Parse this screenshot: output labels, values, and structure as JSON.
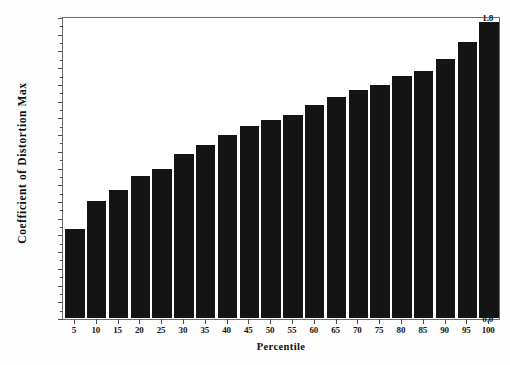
{
  "chart_data": {
    "type": "bar",
    "title": "",
    "xlabel": "Percentile",
    "ylabel": "Coefficient of Distortion Max",
    "categories": [
      "5",
      "10",
      "15",
      "20",
      "25",
      "30",
      "35",
      "40",
      "45",
      "50",
      "55",
      "60",
      "65",
      "70",
      "75",
      "80",
      "85",
      "90",
      "95",
      "100"
    ],
    "values": [
      0.535,
      0.705,
      0.77,
      0.855,
      0.9,
      0.985,
      1.04,
      1.1,
      1.155,
      1.19,
      1.225,
      1.285,
      1.33,
      1.37,
      1.405,
      1.455,
      1.49,
      1.56,
      1.66,
      1.785
    ],
    "ylim": [
      0.0,
      1.8
    ],
    "y_ticks": [
      "0.0",
      "0.1",
      "0.2",
      "0.3",
      "0.4",
      "0.5",
      "0.6",
      "0.7",
      "0.8",
      "0.9",
      "1.0",
      "1.1",
      "1.2",
      "1.3",
      "1.4",
      "1.5",
      "1.6",
      "1.7",
      "1.8"
    ],
    "y_tick_values": [
      0.0,
      0.1,
      0.2,
      0.3,
      0.4,
      0.5,
      0.6,
      0.7,
      0.8,
      0.9,
      1.0,
      1.1,
      1.2,
      1.3,
      1.4,
      1.5,
      1.6,
      1.7,
      1.8
    ],
    "grid": false,
    "legend": "none",
    "bar_color": "#141414",
    "frame_color": "#6f6f6f",
    "background": "#ffffff"
  }
}
